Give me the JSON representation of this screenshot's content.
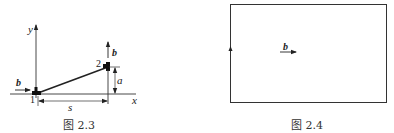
{
  "figures": [
    {
      "id": "fig-2-3",
      "caption": "图 2.3",
      "axes": {
        "x_label": "x",
        "y_label": "y"
      },
      "nodes": [
        {
          "label": "1",
          "x": 0,
          "y": 0
        },
        {
          "label": "2",
          "x": "s",
          "y": "a"
        }
      ],
      "dimensions": {
        "horizontal": "s",
        "vertical": "a"
      },
      "vectors": [
        {
          "label": "b",
          "at_node": "1",
          "direction": "+x"
        },
        {
          "label": "b",
          "at_node": "2",
          "direction": "+y"
        }
      ]
    },
    {
      "id": "fig-2-4",
      "caption": "图 2.4",
      "shape": "rectangle loop",
      "vectors": [
        {
          "label": "b",
          "location": "interior",
          "direction": "+x"
        }
      ],
      "loop_arrow": {
        "side": "left",
        "direction": "up"
      }
    }
  ],
  "labels": {
    "y": "y",
    "x": "x",
    "b": "b",
    "n1": "1",
    "n2": "2",
    "s": "s",
    "a": "a",
    "cap1": "图 2.3",
    "cap2": "图 2.4"
  }
}
